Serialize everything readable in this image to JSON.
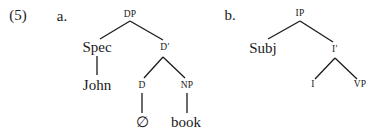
{
  "example": {
    "number": "(5)",
    "tree_a": {
      "label": "a.",
      "root": "DP",
      "spec": "Spec",
      "spec_word": "John",
      "bar": "D′",
      "head": "D",
      "head_word": "∅",
      "complement": "NP",
      "complement_word": "book"
    },
    "tree_b": {
      "label": "b.",
      "root": "IP",
      "spec": "Subj",
      "bar": "I′",
      "head": "I",
      "complement": "VP"
    }
  }
}
